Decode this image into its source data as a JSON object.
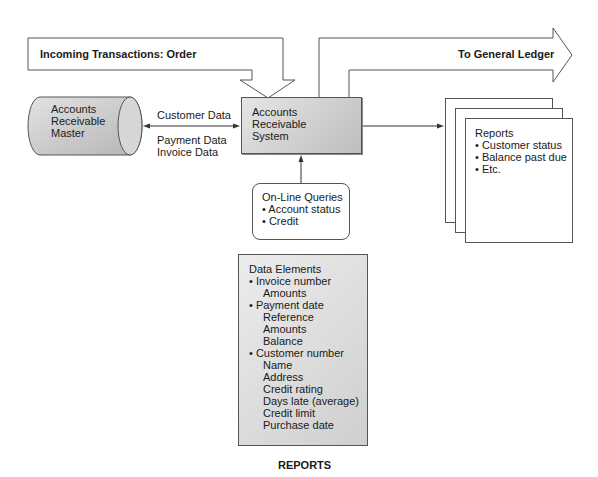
{
  "flows": {
    "incoming": "Incoming Transactions: Order",
    "outgoing": "To General Ledger"
  },
  "master_file": {
    "lines": [
      "Accounts",
      "Receivable",
      "Master"
    ]
  },
  "connection_labels": {
    "top": "Customer Data",
    "bottom": [
      "Payment Data",
      "Invoice Data"
    ]
  },
  "system": {
    "lines": [
      "Accounts",
      "Receivable",
      "System"
    ]
  },
  "queries": {
    "title": "On-Line Queries",
    "items": [
      "• Account status",
      "• Credit"
    ]
  },
  "reports_output": {
    "title": "Reports",
    "items": [
      "• Customer status",
      "• Balance past due",
      "• Etc."
    ]
  },
  "data_elements": {
    "title": "Data Elements",
    "groups": [
      {
        "bullet": "• Invoice number",
        "sub": [
          "Amounts"
        ]
      },
      {
        "bullet": "• Payment date",
        "sub": [
          "Reference",
          "Amounts",
          "Balance"
        ]
      },
      {
        "bullet": "• Customer number",
        "sub": [
          "Name",
          "Address",
          "Credit rating",
          "Days late (average)",
          "Credit limit",
          "Purchase date"
        ]
      }
    ]
  },
  "caption": "REPORTS",
  "colors": {
    "stroke": "#555555",
    "fill_gray_light": "#e6e6e6",
    "fill_gray_dark": "#bdbdbd"
  }
}
